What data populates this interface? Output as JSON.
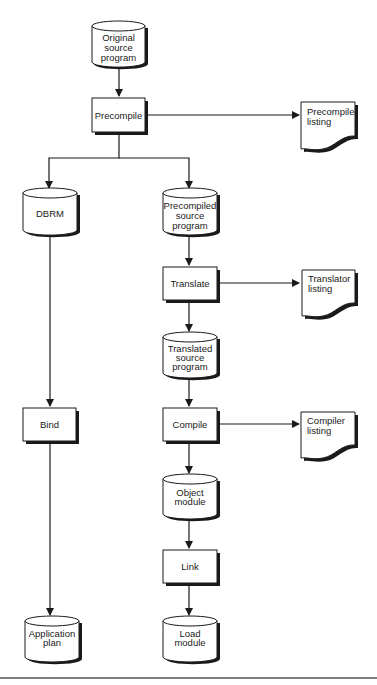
{
  "diagram": {
    "nodes": {
      "original_source": {
        "type": "cylinder",
        "lines": [
          "Original",
          "source",
          "program"
        ]
      },
      "precompile": {
        "type": "process",
        "label": "Precompile"
      },
      "precompiler_listing": {
        "type": "document",
        "lines": [
          "Precompiler",
          "listing"
        ]
      },
      "dbrm": {
        "type": "cylinder",
        "lines": [
          "DBRM"
        ]
      },
      "precompiled_source": {
        "type": "cylinder",
        "lines": [
          "Precompiled",
          "source",
          "program"
        ]
      },
      "translate": {
        "type": "process",
        "label": "Translate"
      },
      "translator_listing": {
        "type": "document",
        "lines": [
          "Translator",
          "listing"
        ]
      },
      "translated_source": {
        "type": "cylinder",
        "lines": [
          "Translated",
          "source",
          "program"
        ]
      },
      "bind": {
        "type": "process",
        "label": "Bind"
      },
      "compile": {
        "type": "process",
        "label": "Compile"
      },
      "compiler_listing": {
        "type": "document",
        "lines": [
          "Compiler",
          "listing"
        ]
      },
      "object_module": {
        "type": "cylinder",
        "lines": [
          "Object",
          "module"
        ]
      },
      "link": {
        "type": "process",
        "label": "Link"
      },
      "application_plan": {
        "type": "cylinder",
        "lines": [
          "Application",
          "plan"
        ]
      },
      "load_module": {
        "type": "cylinder",
        "lines": [
          "Load",
          "module"
        ]
      }
    },
    "edges": [
      [
        "original_source",
        "precompile"
      ],
      [
        "precompile",
        "precompiler_listing"
      ],
      [
        "precompile",
        "dbrm"
      ],
      [
        "precompile",
        "precompiled_source"
      ],
      [
        "precompiled_source",
        "translate"
      ],
      [
        "translate",
        "translator_listing"
      ],
      [
        "translate",
        "translated_source"
      ],
      [
        "translated_source",
        "compile"
      ],
      [
        "compile",
        "compiler_listing"
      ],
      [
        "compile",
        "object_module"
      ],
      [
        "object_module",
        "link"
      ],
      [
        "link",
        "load_module"
      ],
      [
        "dbrm",
        "bind"
      ],
      [
        "bind",
        "application_plan"
      ]
    ]
  }
}
